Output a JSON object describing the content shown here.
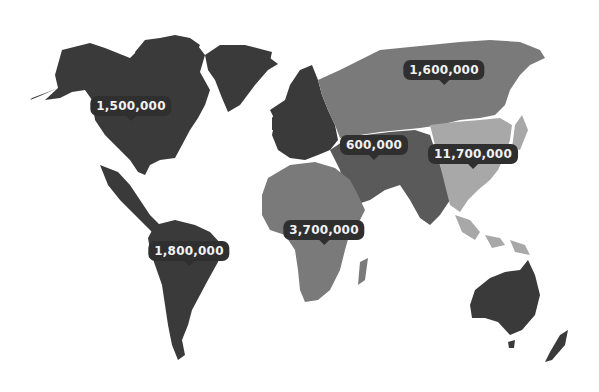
{
  "colors": {
    "dark_region": "#3a3a3a",
    "mid_region": "#7a7a7a",
    "light_region": "#a8a8a8",
    "label_bg": "#2f2f2f",
    "label_text": "#f2f2f2",
    "background": "#ffffff"
  },
  "regions": [
    {
      "name": "North America",
      "value": "1,500,000",
      "shade": "dark"
    },
    {
      "name": "Russia / North Asia",
      "value": "1,600,000",
      "shade": "mid"
    },
    {
      "name": "Europe / Middle East / Central Asia",
      "value": "600,000",
      "shade": "dark"
    },
    {
      "name": "East Asia",
      "value": "11,700,000",
      "shade": "light"
    },
    {
      "name": "Latin America",
      "value": "1,800,000",
      "shade": "dark"
    },
    {
      "name": "Africa",
      "value": "3,700,000",
      "shade": "mid"
    },
    {
      "name": "Oceania",
      "value": "",
      "shade": "dark"
    }
  ]
}
